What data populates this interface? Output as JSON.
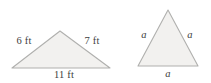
{
  "figure": {
    "name": "two-triangles-geometry-figure",
    "width": 211,
    "height": 83,
    "background_color": "#ffffff",
    "shape_fill_color": "#f2f1ef",
    "shape_stroke_color": "#b0b0ae",
    "label_text_color": "#3d3d3d"
  },
  "triangles": [
    {
      "id": "scalene-triangle",
      "description": "Scalene triangle with side lengths given in feet",
      "points": "12,68 60,31 110,68",
      "vertices": {
        "left": {
          "x": 12,
          "y": 68
        },
        "apex": {
          "x": 60,
          "y": 31
        },
        "right": {
          "x": 110,
          "y": 68
        }
      },
      "labels": [
        {
          "id": "left-side",
          "text": "6 ft",
          "value": 6,
          "unit": "ft",
          "x": 24,
          "y": 41,
          "style": "plain"
        },
        {
          "id": "right-side",
          "text": "7 ft",
          "value": 7,
          "unit": "ft",
          "x": 92,
          "y": 41,
          "style": "plain"
        },
        {
          "id": "base-side",
          "text": "11 ft",
          "value": 11,
          "unit": "ft",
          "x": 64,
          "y": 75,
          "style": "plain"
        }
      ]
    },
    {
      "id": "equilateral-triangle",
      "description": "Equilateral triangle with all sides labeled a",
      "points": "138,66 168,10 198,66",
      "vertices": {
        "left": {
          "x": 138,
          "y": 66
        },
        "apex": {
          "x": 168,
          "y": 10
        },
        "right": {
          "x": 198,
          "y": 66
        }
      },
      "labels": [
        {
          "id": "left-side",
          "text": "a",
          "value": "a",
          "unit": "",
          "x": 144,
          "y": 35,
          "style": "italic"
        },
        {
          "id": "right-side",
          "text": "a",
          "value": "a",
          "unit": "",
          "x": 190,
          "y": 35,
          "style": "italic"
        },
        {
          "id": "base-side",
          "text": "a",
          "value": "a",
          "unit": "",
          "x": 168,
          "y": 74,
          "style": "italic"
        }
      ]
    }
  ]
}
